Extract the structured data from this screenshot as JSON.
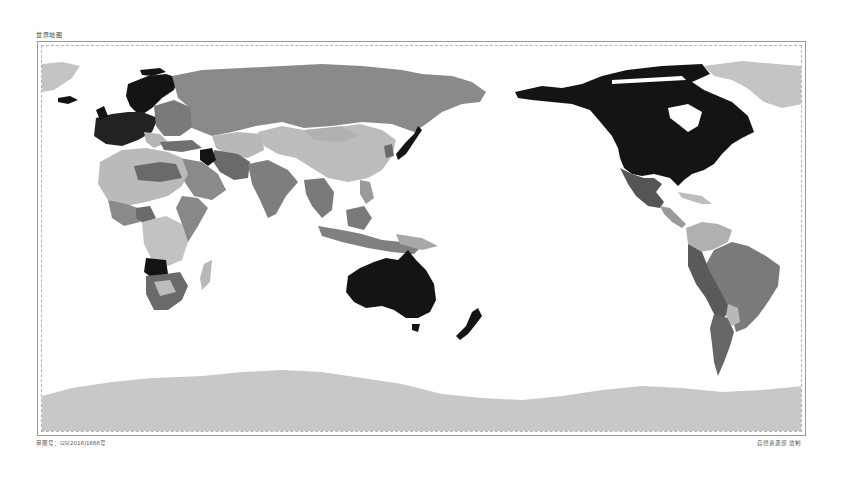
{
  "map": {
    "title": "世界地图",
    "approval_number": "审图号：GS(2016)1666号",
    "publisher": "自然资源部 监制",
    "projection": "Pacific-centered world map",
    "legend_levels": [
      {
        "level": "very-high",
        "color": "#141414"
      },
      {
        "level": "high",
        "color": "#4d4d4d"
      },
      {
        "level": "medium",
        "color": "#7d7d7d"
      },
      {
        "level": "low",
        "color": "#b4b4b4"
      },
      {
        "level": "very-low",
        "color": "#cfcfcf"
      }
    ],
    "highlighted_regions": [
      {
        "name": "Canada & United States",
        "level": "very-high"
      },
      {
        "name": "Australia",
        "level": "very-high"
      },
      {
        "name": "New Zealand",
        "level": "very-high"
      },
      {
        "name": "Japan",
        "level": "very-high"
      },
      {
        "name": "Northern & Western Europe",
        "level": "very-high"
      },
      {
        "name": "Iraq",
        "level": "very-high"
      },
      {
        "name": "Angola",
        "level": "very-high"
      },
      {
        "name": "Russia",
        "level": "medium"
      },
      {
        "name": "China",
        "level": "low"
      },
      {
        "name": "Brazil",
        "level": "medium"
      },
      {
        "name": "Mexico",
        "level": "high"
      },
      {
        "name": "Greenland",
        "level": "very-low"
      },
      {
        "name": "Antarctica",
        "level": "very-low"
      }
    ]
  }
}
